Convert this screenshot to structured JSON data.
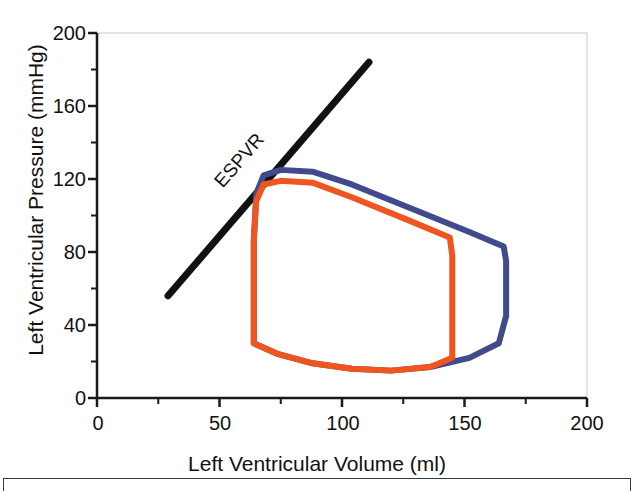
{
  "figure": {
    "kind": "pressure-volume-loop-plot",
    "background": "#ffffff"
  },
  "colors": {
    "axis": "#1a1a1a",
    "text": "#111111",
    "espvr_line": "#111111",
    "loop_blue": "#414a8c",
    "loop_orange": "#f1551f",
    "frame": "#3a3a3a"
  },
  "chart_data": {
    "type": "line",
    "title": "",
    "subtitle": "",
    "xlabel": "Left Ventricular Volume (ml)",
    "ylabel": "Left Ventricular Pressure (mmHg)",
    "xlim": [
      0,
      200
    ],
    "ylim": [
      0,
      200
    ],
    "grid": false,
    "legend_position": "none",
    "xticks": [
      0,
      50,
      100,
      150,
      200
    ],
    "xtick_labels": [
      "0",
      "50",
      "100",
      "150",
      "200"
    ],
    "x_minor_tick_interval": 25,
    "yticks": [
      0,
      40,
      80,
      120,
      160,
      200
    ],
    "ytick_labels": [
      "0",
      "40",
      "80",
      "120",
      "160",
      "200"
    ],
    "y_minor_tick_interval": 20,
    "annotations": [
      {
        "text": "ESPVR",
        "x": 60,
        "y": 128,
        "rotation_deg": -49,
        "color": "#111111"
      }
    ],
    "series": [
      {
        "name": "ESPVR",
        "type": "line",
        "color": "#111111",
        "width": 7,
        "points": [
          [
            29,
            56
          ],
          [
            111,
            184
          ]
        ]
      },
      {
        "name": "Control PV loop (blue)",
        "type": "closed-loop",
        "color": "#414a8c",
        "width": 6,
        "points": [
          [
            64,
            30
          ],
          [
            64,
            86
          ],
          [
            65,
            112
          ],
          [
            68,
            122
          ],
          [
            75,
            125
          ],
          [
            88,
            124
          ],
          [
            104,
            117
          ],
          [
            128,
            104
          ],
          [
            152,
            91
          ],
          [
            166,
            83
          ],
          [
            167,
            75
          ],
          [
            167,
            45
          ],
          [
            164,
            30
          ],
          [
            152,
            22
          ],
          [
            136,
            17
          ],
          [
            120,
            15
          ],
          [
            104,
            16
          ],
          [
            88,
            19
          ],
          [
            74,
            24
          ],
          [
            64,
            30
          ]
        ]
      },
      {
        "name": "Treated PV loop (orange)",
        "type": "closed-loop",
        "color": "#f1551f",
        "width": 6,
        "points": [
          [
            64,
            30
          ],
          [
            64,
            86
          ],
          [
            65,
            108
          ],
          [
            68,
            117
          ],
          [
            75,
            119
          ],
          [
            88,
            118
          ],
          [
            104,
            110
          ],
          [
            126,
            98
          ],
          [
            144,
            88
          ],
          [
            145,
            78
          ],
          [
            145,
            45
          ],
          [
            145,
            22
          ],
          [
            136,
            17
          ],
          [
            120,
            15
          ],
          [
            104,
            16
          ],
          [
            88,
            19
          ],
          [
            74,
            24
          ],
          [
            64,
            30
          ]
        ]
      }
    ]
  },
  "axes": {
    "ytick_labels": [
      {
        "value": "200",
        "top": 22
      },
      {
        "value": "160",
        "top": 95
      },
      {
        "value": "120",
        "top": 168
      },
      {
        "value": "80",
        "top": 241
      },
      {
        "value": "40",
        "top": 314
      },
      {
        "value": "0",
        "top": 387
      }
    ],
    "xtick_labels": [
      {
        "value": "0",
        "left": 68
      },
      {
        "value": "50",
        "left": 190
      },
      {
        "value": "100",
        "left": 313
      },
      {
        "value": "150",
        "left": 435
      },
      {
        "value": "200",
        "left": 557
      }
    ]
  }
}
